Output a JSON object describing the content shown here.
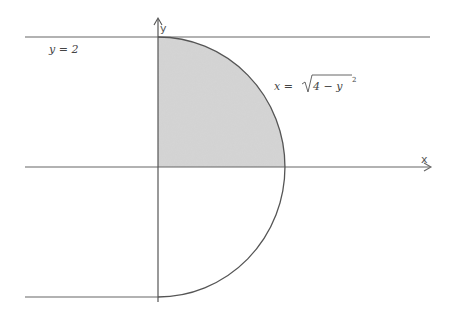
{
  "diagram": {
    "axes": {
      "x_label": "x",
      "y_label": "y"
    },
    "annotations": {
      "line_top": "y = 2",
      "curve_lhs": "x = ",
      "curve_rad": "4 − y",
      "curve_exp": "2"
    },
    "colors": {
      "stroke": "#555555",
      "fill": "#cfcfcf",
      "background": "#ffffff"
    }
  }
}
